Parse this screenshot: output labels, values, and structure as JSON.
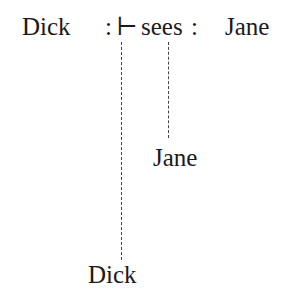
{
  "judgment": {
    "subject": "Dick",
    "colon1": ":",
    "turnstile": "⊢",
    "verb": "sees",
    "colon2": ":",
    "object": "Jane"
  },
  "projections": [
    {
      "label": "Jane",
      "from": "sees"
    },
    {
      "label": "Dick",
      "from": "turnstile"
    }
  ]
}
